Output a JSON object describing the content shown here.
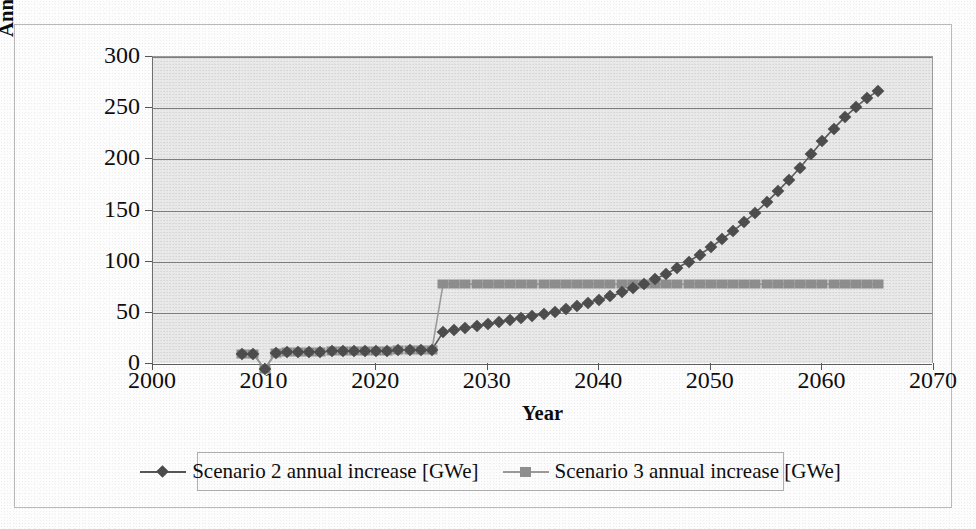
{
  "figure": {
    "caption_present": false,
    "background": "#e9e9e9",
    "page_background": "#fdfdfd"
  },
  "axes": {
    "y_title_line1": "Annual increase of nuclear capacity",
    "y_title_line2": "[GWe]",
    "x_title": "Year",
    "y_ticks": [
      "0",
      "50",
      "100",
      "150",
      "200",
      "250",
      "300"
    ],
    "x_ticks": [
      "2000",
      "2010",
      "2020",
      "2030",
      "2040",
      "2050",
      "2060",
      "2070"
    ]
  },
  "legend": {
    "items": [
      {
        "label": "Scenario 2 annual increase [GWe]",
        "marker": "diamond",
        "color": "#4c4c4c"
      },
      {
        "label": "Scenario 3 annual increase [GWe]",
        "marker": "square",
        "color": "#8d8d8d"
      }
    ]
  },
  "chart_data": {
    "type": "line",
    "title": "",
    "xlabel": "Year",
    "ylabel": "Annual increase of nuclear capacity [GWe]",
    "xlim": [
      2000,
      2070
    ],
    "ylim": [
      0,
      300
    ],
    "ytick_step": 50,
    "xtick_step": 10,
    "grid": "horizontal",
    "legend_position": "bottom",
    "x": [
      2008,
      2009,
      2010,
      2011,
      2012,
      2013,
      2014,
      2015,
      2016,
      2017,
      2018,
      2019,
      2020,
      2021,
      2022,
      2023,
      2024,
      2025,
      2026,
      2027,
      2028,
      2029,
      2030,
      2031,
      2032,
      2033,
      2034,
      2035,
      2036,
      2037,
      2038,
      2039,
      2040,
      2041,
      2042,
      2043,
      2044,
      2045,
      2046,
      2047,
      2048,
      2049,
      2050,
      2051,
      2052,
      2053,
      2054,
      2055,
      2056,
      2057,
      2058,
      2059,
      2060,
      2061,
      2062,
      2063,
      2064,
      2065
    ],
    "series": [
      {
        "name": "Scenario 2 annual increase [GWe]",
        "marker": "diamond",
        "color": "#4c4c4c",
        "values": [
          10,
          10,
          -5,
          11,
          12,
          12,
          12,
          12,
          13,
          13,
          13,
          13,
          13,
          13,
          14,
          14,
          14,
          14,
          31,
          33,
          35,
          37,
          39,
          41,
          43,
          45,
          47,
          49,
          51,
          54,
          57,
          60,
          63,
          66,
          70,
          74,
          78,
          83,
          88,
          94,
          100,
          107,
          114,
          122,
          130,
          139,
          148,
          158,
          169,
          180,
          192,
          205,
          218,
          230,
          241,
          251,
          260,
          267
        ]
      },
      {
        "name": "Scenario 3 annual increase [GWe]",
        "marker": "square",
        "color": "#8d8d8d",
        "values": [
          10,
          10,
          -5,
          11,
          12,
          12,
          12,
          12,
          13,
          13,
          13,
          13,
          13,
          13,
          14,
          14,
          14,
          14,
          78,
          78,
          78,
          78,
          78,
          78,
          78,
          78,
          78,
          78,
          78,
          78,
          78,
          78,
          78,
          78,
          78,
          78,
          78,
          78,
          78,
          78,
          78,
          78,
          78,
          78,
          78,
          78,
          78,
          78,
          78,
          78,
          78,
          78,
          78,
          78,
          78,
          78,
          78,
          78
        ]
      }
    ],
    "annotations": [
      {
        "text": "Scenario 3 steps up to ~78 GWe in 2026 and stays flat",
        "year": 2026
      },
      {
        "text": "Scenario 2 crosses Scenario 3 near 2043",
        "year": 2043
      }
    ]
  }
}
